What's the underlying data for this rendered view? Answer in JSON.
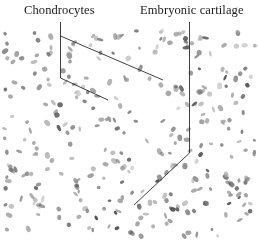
{
  "figure": {
    "labels": {
      "chondrocytes": "Chondrocytes",
      "embryonic_cartilage": "Embryonic cartilage"
    },
    "colors": {
      "background": "#ffffff",
      "nucleus": "#6e6e6e",
      "leader_line": "#2b2b2b"
    }
  }
}
